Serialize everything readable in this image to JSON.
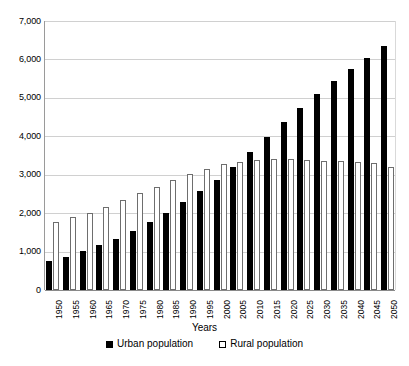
{
  "chart_data": {
    "type": "bar",
    "title": "",
    "xlabel": "Years",
    "ylabel": "",
    "ylim": [
      0,
      7000
    ],
    "ytick_values": [
      0,
      1000,
      2000,
      3000,
      4000,
      5000,
      6000,
      7000
    ],
    "ytick_labels": [
      "0",
      "1,000",
      "2,000",
      "3,000",
      "4,000",
      "5,000",
      "6,000",
      "7,000"
    ],
    "grid": true,
    "legend_position": "bottom",
    "categories": [
      "1950",
      "1955",
      "1960",
      "1965",
      "1970",
      "1975",
      "1980",
      "1985",
      "1990",
      "1995",
      "2000",
      "2005",
      "2010",
      "2015",
      "2020",
      "2025",
      "2030",
      "2035",
      "2040",
      "2045",
      "2050"
    ],
    "series": [
      {
        "name": "Urban population",
        "color": "#000000",
        "values": [
          750,
          870,
          1020,
          1180,
          1340,
          1540,
          1760,
          2010,
          2290,
          2570,
          2860,
          3190,
          3590,
          3980,
          4370,
          4740,
          5100,
          5430,
          5750,
          6050,
          6350
        ]
      },
      {
        "name": "Rural population",
        "color": "#ffffff",
        "values": [
          1780,
          1900,
          2010,
          2150,
          2340,
          2530,
          2680,
          2860,
          3030,
          3150,
          3270,
          3330,
          3380,
          3400,
          3400,
          3390,
          3370,
          3350,
          3330,
          3300,
          3210
        ]
      }
    ]
  },
  "axis": {
    "x_title": "Years"
  },
  "legend": {
    "items": [
      {
        "label": "Urban population",
        "marker": "filled-square"
      },
      {
        "label": "Rural population",
        "marker": "open-square"
      }
    ]
  },
  "colors": {
    "urban": "#000000",
    "rural_fill": "#ffffff",
    "rural_stroke": "#6e6e6e",
    "gridline": "#d0d0d0",
    "axis": "#8a8a8a",
    "text": "#000000",
    "background": "#ffffff"
  }
}
